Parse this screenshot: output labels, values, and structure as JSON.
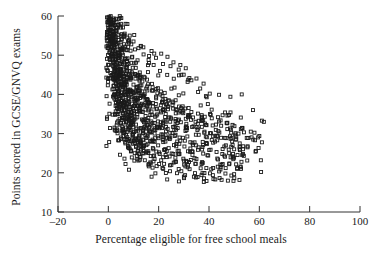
{
  "chart_data": {
    "type": "scatter",
    "title": "",
    "xlabel": "Percentage eligible for free school meals",
    "ylabel": "Points scored in GCSE/GNVQ exams",
    "xlim": [
      -20,
      100
    ],
    "ylim": [
      10,
      60
    ],
    "xticks": [
      -20,
      0,
      20,
      40,
      60,
      80,
      100
    ],
    "yticks": [
      10,
      20,
      30,
      40,
      50,
      60
    ],
    "xtick_labels": [
      "–20",
      "0",
      "20",
      "40",
      "60",
      "80",
      "100"
    ],
    "ytick_labels": [
      "10",
      "20",
      "30",
      "40",
      "50",
      "60"
    ],
    "grid": false,
    "legend": null,
    "marker": "open-square",
    "marker_color": "#1a1a1a",
    "marker_size": 3,
    "n_points": 1200,
    "series": [
      {
        "name": "schools",
        "points": [
          [
            0.4,
            59.8
          ],
          [
            0.7,
            59.2
          ],
          [
            1.0,
            58.4
          ],
          [
            0.5,
            57.9
          ],
          [
            1.3,
            57.2
          ],
          [
            0.9,
            56.5
          ],
          [
            1.6,
            56.0
          ],
          [
            0.6,
            55.4
          ],
          [
            1.2,
            54.8
          ],
          [
            2.0,
            54.2
          ],
          [
            0.8,
            53.6
          ],
          [
            1.5,
            53.0
          ],
          [
            2.3,
            52.5
          ],
          [
            1.1,
            52.0
          ],
          [
            1.8,
            51.4
          ],
          [
            2.6,
            50.9
          ],
          [
            1.4,
            50.3
          ],
          [
            2.1,
            49.8
          ],
          [
            3.0,
            49.2
          ],
          [
            1.7,
            48.7
          ],
          [
            2.4,
            48.2
          ],
          [
            3.3,
            47.6
          ],
          [
            2.0,
            47.1
          ],
          [
            2.8,
            46.6
          ],
          [
            3.7,
            46.1
          ],
          [
            2.3,
            45.6
          ],
          [
            3.1,
            45.1
          ],
          [
            4.0,
            44.6
          ],
          [
            2.6,
            44.1
          ],
          [
            3.5,
            43.7
          ],
          [
            4.4,
            43.2
          ],
          [
            3.0,
            42.7
          ],
          [
            3.9,
            42.3
          ],
          [
            4.9,
            41.8
          ],
          [
            3.4,
            41.4
          ],
          [
            4.3,
            40.9
          ],
          [
            5.4,
            40.5
          ],
          [
            3.8,
            40.1
          ],
          [
            4.8,
            39.6
          ],
          [
            5.9,
            39.2
          ],
          [
            4.2,
            38.8
          ],
          [
            5.3,
            38.4
          ],
          [
            6.5,
            38.0
          ],
          [
            4.7,
            37.6
          ],
          [
            5.9,
            37.2
          ],
          [
            7.2,
            36.8
          ],
          [
            5.2,
            36.4
          ],
          [
            6.5,
            36.0
          ],
          [
            8.0,
            35.6
          ],
          [
            5.8,
            35.2
          ],
          [
            7.2,
            34.9
          ],
          [
            8.9,
            34.5
          ],
          [
            6.4,
            34.1
          ],
          [
            8.0,
            33.8
          ],
          [
            9.9,
            33.4
          ],
          [
            7.1,
            33.0
          ],
          [
            8.9,
            32.7
          ],
          [
            11.0,
            32.3
          ],
          [
            7.9,
            32.0
          ],
          [
            9.9,
            31.6
          ],
          [
            12.3,
            31.3
          ],
          [
            8.8,
            30.9
          ],
          [
            11.0,
            30.6
          ],
          [
            13.8,
            30.2
          ],
          [
            9.8,
            29.9
          ],
          [
            12.3,
            29.5
          ],
          [
            15.5,
            29.2
          ],
          [
            11.0,
            28.8
          ],
          [
            13.8,
            28.5
          ],
          [
            17.5,
            28.1
          ],
          [
            12.4,
            27.8
          ],
          [
            15.6,
            27.4
          ],
          [
            19.8,
            27.0
          ],
          [
            14.0,
            26.7
          ],
          [
            17.7,
            26.3
          ],
          [
            22.5,
            25.9
          ],
          [
            15.9,
            25.5
          ],
          [
            20.2,
            25.2
          ],
          [
            25.8,
            24.8
          ],
          [
            18.2,
            24.4
          ],
          [
            23.2,
            24.0
          ],
          [
            29.8,
            23.6
          ],
          [
            21.0,
            23.2
          ],
          [
            26.9,
            22.8
          ],
          [
            34.7,
            22.3
          ],
          [
            24.5,
            21.9
          ],
          [
            31.5,
            21.4
          ],
          [
            40.9,
            20.9
          ],
          [
            29.0,
            20.4
          ],
          [
            37.4,
            19.9
          ],
          [
            48.9,
            19.3
          ],
          [
            34.8,
            18.8
          ],
          [
            45.0,
            18.2
          ],
          [
            39.0,
            17.9
          ],
          [
            1.0,
            58.9
          ],
          [
            1.9,
            57.6
          ],
          [
            2.5,
            56.2
          ],
          [
            1.4,
            55.0
          ],
          [
            2.9,
            53.9
          ],
          [
            3.4,
            52.8
          ],
          [
            2.2,
            51.7
          ],
          [
            3.8,
            50.7
          ],
          [
            4.3,
            49.7
          ],
          [
            3.0,
            48.8
          ],
          [
            4.7,
            47.9
          ],
          [
            5.2,
            47.0
          ],
          [
            3.9,
            46.2
          ],
          [
            5.6,
            45.4
          ],
          [
            6.2,
            44.6
          ],
          [
            4.8,
            43.9
          ],
          [
            6.7,
            43.2
          ],
          [
            7.3,
            42.5
          ],
          [
            5.9,
            41.8
          ],
          [
            7.9,
            41.2
          ],
          [
            8.6,
            40.5
          ],
          [
            7.0,
            39.9
          ],
          [
            9.3,
            39.3
          ],
          [
            10.1,
            38.7
          ],
          [
            8.3,
            38.1
          ],
          [
            10.9,
            37.6
          ],
          [
            11.8,
            37.0
          ],
          [
            9.8,
            36.5
          ],
          [
            12.7,
            36.0
          ],
          [
            13.7,
            35.5
          ],
          [
            11.5,
            35.0
          ],
          [
            14.8,
            34.5
          ],
          [
            15.9,
            34.0
          ],
          [
            13.4,
            33.6
          ],
          [
            17.1,
            33.1
          ],
          [
            18.4,
            32.7
          ],
          [
            15.6,
            32.2
          ],
          [
            19.8,
            31.8
          ],
          [
            21.3,
            31.4
          ],
          [
            18.2,
            31.0
          ],
          [
            22.9,
            30.6
          ],
          [
            24.6,
            30.2
          ],
          [
            21.1,
            29.8
          ],
          [
            26.4,
            29.4
          ],
          [
            28.3,
            29.0
          ],
          [
            24.4,
            28.6
          ],
          [
            30.4,
            28.2
          ],
          [
            32.6,
            27.8
          ],
          [
            28.2,
            27.4
          ],
          [
            34.9,
            27.0
          ],
          [
            37.4,
            26.6
          ],
          [
            32.6,
            26.2
          ],
          [
            40.1,
            25.8
          ],
          [
            43.0,
            25.3
          ],
          [
            37.7,
            24.9
          ],
          [
            46.1,
            24.4
          ],
          [
            49.4,
            23.9
          ],
          [
            43.6,
            23.4
          ],
          [
            52.9,
            22.8
          ],
          [
            48.0,
            22.2
          ],
          [
            2.2,
            59.0
          ],
          [
            3.1,
            57.0
          ],
          [
            4.0,
            55.2
          ],
          [
            2.7,
            53.5
          ],
          [
            4.6,
            52.0
          ],
          [
            5.5,
            50.6
          ],
          [
            3.9,
            49.3
          ],
          [
            6.2,
            48.1
          ],
          [
            7.1,
            47.0
          ],
          [
            5.2,
            46.0
          ],
          [
            8.0,
            45.0
          ],
          [
            9.0,
            44.1
          ],
          [
            6.8,
            43.3
          ],
          [
            10.0,
            42.5
          ],
          [
            11.1,
            41.7
          ],
          [
            8.6,
            41.0
          ],
          [
            12.3,
            40.3
          ],
          [
            13.5,
            39.7
          ],
          [
            10.7,
            39.1
          ],
          [
            14.8,
            38.5
          ],
          [
            16.2,
            37.9
          ],
          [
            13.1,
            37.4
          ],
          [
            17.7,
            36.9
          ],
          [
            19.3,
            36.4
          ],
          [
            15.9,
            35.9
          ],
          [
            21.0,
            35.4
          ],
          [
            22.8,
            35.0
          ],
          [
            19.1,
            34.6
          ],
          [
            24.7,
            34.1
          ],
          [
            26.7,
            33.7
          ],
          [
            22.7,
            33.3
          ],
          [
            28.8,
            32.9
          ],
          [
            31.0,
            32.5
          ],
          [
            26.7,
            32.1
          ],
          [
            33.3,
            31.7
          ],
          [
            35.7,
            31.3
          ],
          [
            31.1,
            30.9
          ],
          [
            38.2,
            30.5
          ],
          [
            40.8,
            30.1
          ],
          [
            35.9,
            29.7
          ],
          [
            43.5,
            29.3
          ],
          [
            46.3,
            28.9
          ],
          [
            41.1,
            28.4
          ],
          [
            49.2,
            28.0
          ],
          [
            52.2,
            27.5
          ],
          [
            46.7,
            27.0
          ],
          [
            55.3,
            26.5
          ],
          [
            50.0,
            26.0
          ],
          [
            58.5,
            25.4
          ],
          [
            53.5,
            24.8
          ],
          [
            5.0,
            58.0
          ],
          [
            6.5,
            55.5
          ],
          [
            8.2,
            53.2
          ],
          [
            7.1,
            51.3
          ],
          [
            9.5,
            49.6
          ],
          [
            11.0,
            48.1
          ],
          [
            9.7,
            46.8
          ],
          [
            12.5,
            45.6
          ],
          [
            14.1,
            44.5
          ],
          [
            12.4,
            43.5
          ],
          [
            15.8,
            42.6
          ],
          [
            17.6,
            41.8
          ],
          [
            15.5,
            41.0
          ],
          [
            19.5,
            40.3
          ],
          [
            21.5,
            39.6
          ],
          [
            19.0,
            39.0
          ],
          [
            23.6,
            38.4
          ],
          [
            25.8,
            37.9
          ],
          [
            22.9,
            37.4
          ],
          [
            28.1,
            36.9
          ],
          [
            30.5,
            36.4
          ],
          [
            27.2,
            36.0
          ],
          [
            33.0,
            35.5
          ],
          [
            35.6,
            35.1
          ],
          [
            32.0,
            34.7
          ],
          [
            38.3,
            34.3
          ],
          [
            41.1,
            33.9
          ],
          [
            37.2,
            33.5
          ],
          [
            44.0,
            33.1
          ],
          [
            47.0,
            32.7
          ],
          [
            42.8,
            32.3
          ],
          [
            50.1,
            31.9
          ],
          [
            53.3,
            31.4
          ],
          [
            48.7,
            31.0
          ],
          [
            56.6,
            30.5
          ],
          [
            51.7,
            30.0
          ],
          [
            60.0,
            29.4
          ],
          [
            55.0,
            28.9
          ],
          [
            58.3,
            28.3
          ],
          [
            61.8,
            33.0
          ],
          [
            23.5,
            49.6
          ],
          [
            24.7,
            47.2
          ],
          [
            33.0,
            43.6
          ],
          [
            36.5,
            41.5
          ],
          [
            40.3,
            40.2
          ],
          [
            44.0,
            39.9
          ],
          [
            48.5,
            39.4
          ],
          [
            53.0,
            40.0
          ],
          [
            57.5,
            36.0
          ],
          [
            61.0,
            33.3
          ],
          [
            29.0,
            45.0
          ],
          [
            31.5,
            43.2
          ],
          [
            26.0,
            44.0
          ],
          [
            20.5,
            46.0
          ],
          [
            18.0,
            47.5
          ],
          [
            16.0,
            48.8
          ],
          [
            14.0,
            50.2
          ],
          [
            12.0,
            51.8
          ],
          [
            10.0,
            53.5
          ],
          [
            8.5,
            55.0
          ],
          [
            3.5,
            31.0
          ],
          [
            5.0,
            29.0
          ],
          [
            6.8,
            27.5
          ],
          [
            8.5,
            26.2
          ],
          [
            10.5,
            25.0
          ],
          [
            12.5,
            24.0
          ],
          [
            14.5,
            23.2
          ],
          [
            16.8,
            22.4
          ],
          [
            19.2,
            21.7
          ],
          [
            21.8,
            21.0
          ],
          [
            24.5,
            20.4
          ],
          [
            27.3,
            19.9
          ],
          [
            30.5,
            19.4
          ],
          [
            34.0,
            19.0
          ],
          [
            38.0,
            18.6
          ],
          [
            42.5,
            18.3
          ],
          [
            47.5,
            18.0
          ],
          [
            52.5,
            21.6
          ],
          [
            48.0,
            25.0
          ],
          [
            45.0,
            22.0
          ],
          [
            2.0,
            44.0
          ],
          [
            2.5,
            40.0
          ],
          [
            3.0,
            38.0
          ],
          [
            3.5,
            36.5
          ],
          [
            4.0,
            35.0
          ],
          [
            4.5,
            33.8
          ],
          [
            5.0,
            32.7
          ],
          [
            5.5,
            31.8
          ],
          [
            6.0,
            31.0
          ],
          [
            6.5,
            30.3
          ],
          [
            7.0,
            29.7
          ],
          [
            7.5,
            29.1
          ],
          [
            8.0,
            28.6
          ],
          [
            9.0,
            28.0
          ],
          [
            10.0,
            27.4
          ],
          [
            11.0,
            26.9
          ],
          [
            12.0,
            26.4
          ],
          [
            13.0,
            26.0
          ],
          [
            14.0,
            25.6
          ],
          [
            15.0,
            25.2
          ]
        ]
      }
    ]
  },
  "axes": {
    "x_title": "Percentage eligible for free school meals",
    "y_title": "Points scored in GCSE/GNVQ exams"
  }
}
